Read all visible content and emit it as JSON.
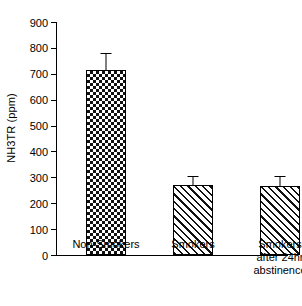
{
  "chart_data": {
    "type": "bar",
    "title": "",
    "xlabel": "",
    "ylabel": "NH3TR (ppm)",
    "ylim": [
      0,
      900
    ],
    "ytick_step": 100,
    "yticks": [
      900,
      800,
      700,
      600,
      500,
      400,
      300,
      200,
      100,
      0
    ],
    "ytick_labels": [
      "900",
      "800",
      "700",
      "600",
      "500",
      "400",
      "300",
      "200",
      "100",
      "0"
    ],
    "grid": false,
    "legend": "none",
    "categories": [
      "Non-Smokers",
      "Smokers",
      "Smokers after 24hr abstinence"
    ],
    "category_lines": [
      [
        "Non-Smokers"
      ],
      [
        "Smokers"
      ],
      [
        "Smokers",
        "after 24hr",
        "abstinence"
      ]
    ],
    "values": [
      715,
      270,
      265
    ],
    "errors": [
      65,
      35,
      40
    ],
    "bars": [
      {
        "label": "Non-Smokers",
        "value": 715,
        "error": 65,
        "pattern": "checkerboard"
      },
      {
        "label": "Smokers",
        "value": 270,
        "error": 35,
        "pattern": "diagonal"
      },
      {
        "label": "Smokers after 24hr abstinence",
        "value": 265,
        "error": 40,
        "pattern": "diagonal"
      }
    ],
    "colors": {
      "axis": "#000000",
      "bar_outline": "#000000",
      "bar_fill": "#ffffff",
      "hatch": "#111111",
      "background": "#ffffff"
    }
  }
}
